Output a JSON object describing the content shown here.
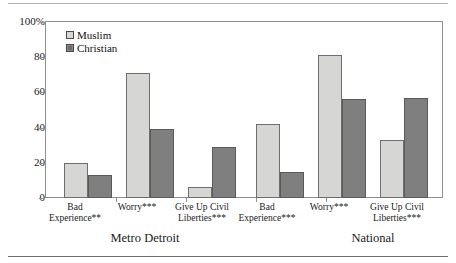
{
  "chart_data": {
    "type": "bar",
    "title": "",
    "subtitle": "",
    "xlabel": "",
    "ylabel": "",
    "ylim": [
      0,
      100
    ],
    "yticks": [
      "0",
      "20",
      "40",
      "60",
      "80",
      "100%"
    ],
    "ytick_values": [
      0,
      20,
      40,
      60,
      80,
      100
    ],
    "grid": false,
    "legend_position": "top-left",
    "panels": [
      "Metro Detroit",
      "National"
    ],
    "categories": [
      "Bad Experience**",
      "Worry***",
      "Give Up Civil Liberties***",
      "Bad Experience***",
      "Worry***",
      "Give Up Civil Liberties***"
    ],
    "series": [
      {
        "name": "Muslim",
        "values": [
          20,
          71,
          6,
          42,
          81,
          33
        ]
      },
      {
        "name": "Christian",
        "values": [
          13,
          39,
          29,
          15,
          56,
          57
        ]
      }
    ]
  },
  "legend": {
    "items": [
      {
        "label": "Muslim",
        "color": "#d6d6d4"
      },
      {
        "label": "Christian",
        "color": "#7f7f7f"
      }
    ]
  },
  "axis": {
    "y": {
      "t100": "100%",
      "t80": "80",
      "t60": "60",
      "t40": "40",
      "t20": "20",
      "t0": "0"
    }
  },
  "categories": {
    "g0_l1": "Bad",
    "g0_l2": "Experience**",
    "g1_l1": "Worry***",
    "g1_l2": "",
    "g2_l1": "Give Up Civil",
    "g2_l2": "Liberties***",
    "g3_l1": "Bad",
    "g3_l2": "Experience***",
    "g4_l1": "Worry***",
    "g4_l2": "",
    "g5_l1": "Give Up Civil",
    "g5_l2": "Liberties***"
  },
  "panels": {
    "left": "Metro Detroit",
    "right": "National"
  }
}
